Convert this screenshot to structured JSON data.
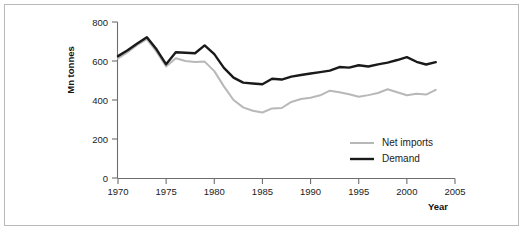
{
  "chart_data": {
    "type": "line",
    "title": "",
    "xlabel": "Year",
    "ylabel": "Mn tonnes",
    "xlim": [
      1970,
      2005
    ],
    "ylim": [
      0,
      800
    ],
    "xticks": [
      1970,
      1975,
      1980,
      1985,
      1990,
      1995,
      2000,
      2005
    ],
    "yticks": [
      0,
      200,
      400,
      600,
      800
    ],
    "grid": false,
    "legend_position": "bottom-right",
    "x": [
      1970,
      1971,
      1972,
      1973,
      1974,
      1975,
      1976,
      1977,
      1978,
      1979,
      1980,
      1981,
      1982,
      1983,
      1984,
      1985,
      1986,
      1987,
      1988,
      1989,
      1990,
      1991,
      1992,
      1993,
      1994,
      1995,
      1996,
      1997,
      1998,
      1999,
      2000,
      2001,
      2002,
      2003
    ],
    "series": [
      {
        "name": "Demand",
        "color": "#1a1a1a",
        "width": 2.4,
        "values": [
          625,
          655,
          690,
          722,
          660,
          583,
          645,
          642,
          640,
          680,
          635,
          565,
          515,
          489,
          485,
          481,
          509,
          505,
          520,
          528,
          536,
          543,
          551,
          569,
          566,
          578,
          572,
          583,
          592,
          605,
          620,
          596,
          582,
          594
        ]
      },
      {
        "name": "Net imports",
        "color": "#b8b8b8",
        "width": 2.0,
        "values": [
          613,
          645,
          682,
          712,
          648,
          572,
          614,
          600,
          595,
          597,
          548,
          470,
          400,
          362,
          345,
          336,
          357,
          359,
          390,
          405,
          412,
          424,
          448,
          440,
          429,
          417,
          425,
          436,
          455,
          440,
          424,
          432,
          428,
          452
        ]
      }
    ]
  },
  "legend": {
    "items": [
      {
        "label": "Net imports",
        "color": "#b8b8b8"
      },
      {
        "label": "Demand",
        "color": "#1a1a1a"
      }
    ]
  },
  "axes": {
    "y_title": "Mn tonnes",
    "x_title": "Year",
    "y_tick_labels": [
      "0",
      "200",
      "400",
      "600",
      "800"
    ],
    "x_tick_labels": [
      "1970",
      "1975",
      "1980",
      "1985",
      "1990",
      "1995",
      "2000",
      "2005"
    ]
  }
}
